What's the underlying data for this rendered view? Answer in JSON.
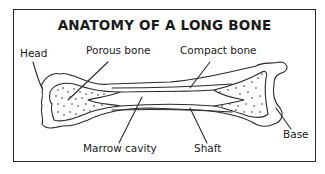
{
  "title": "ANATOMY OF A LONG BONE",
  "labels": {
    "head": "Head",
    "porous_bone": "Porous bone",
    "compact_bone": "Compact bone",
    "base": "Base",
    "marrow_cavity": "Marrow cavity",
    "shaft": "Shaft"
  },
  "colors": {
    "line": "#2a2a2a",
    "background": "#ffffff"
  }
}
